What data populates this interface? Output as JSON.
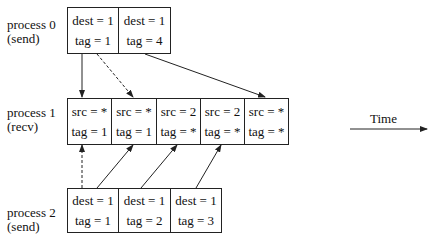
{
  "processes": [
    {
      "name": "process 0",
      "role": "(send)",
      "cells": [
        {
          "line1": "dest = 1",
          "line2": "tag = 1"
        },
        {
          "line1": "dest = 1",
          "line2": "tag = 4"
        }
      ]
    },
    {
      "name": "process 1",
      "role": "(recv)",
      "cells": [
        {
          "line1": "src = *",
          "line2": "tag = 1"
        },
        {
          "line1": "src = *",
          "line2": "tag = 1"
        },
        {
          "line1": "src = 2",
          "line2": "tag = *"
        },
        {
          "line1": "src = 2",
          "line2": "tag = *"
        },
        {
          "line1": "src = *",
          "line2": "tag = *"
        }
      ]
    },
    {
      "name": "process 2",
      "role": "(send)",
      "cells": [
        {
          "line1": "dest = 1",
          "line2": "tag = 1"
        },
        {
          "line1": "dest = 1",
          "line2": "tag = 2"
        },
        {
          "line1": "dest = 1",
          "line2": "tag = 3"
        }
      ]
    }
  ],
  "time_axis": {
    "label": "Time"
  },
  "matches": [
    {
      "from": "process 0 cell 1",
      "to": "process 1 cell 1",
      "style": "solid"
    },
    {
      "from": "process 0 cell 1",
      "to": "process 1 cell 2",
      "style": "dashed"
    },
    {
      "from": "process 0 cell 2",
      "to": "process 1 cell 5",
      "style": "solid"
    },
    {
      "from": "process 2 cell 1",
      "to": "process 1 cell 1",
      "style": "dashed"
    },
    {
      "from": "process 2 cell 1",
      "to": "process 1 cell 2",
      "style": "solid"
    },
    {
      "from": "process 2 cell 2",
      "to": "process 1 cell 3",
      "style": "solid"
    },
    {
      "from": "process 2 cell 3",
      "to": "process 1 cell 4",
      "style": "solid"
    }
  ]
}
